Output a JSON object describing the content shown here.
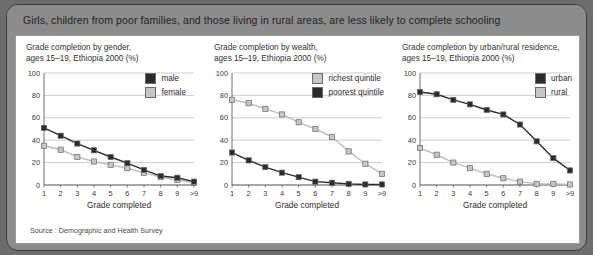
{
  "header": {
    "title": "Girls, children from poor families, and those living in rural areas, are less likely to complete schooling",
    "background": "#8c8c8c",
    "text_color": "#1f1f1f"
  },
  "source": {
    "label": "Source : Demographic and Health Survey"
  },
  "colors": {
    "dark_marker": "#2b2b2b",
    "light_marker": "#c6c6c6",
    "marker_edge": "#6b6b6b",
    "gridline": "#b9b9b9",
    "axis": "#4a4a4a",
    "panel_background": "#ffffff"
  },
  "chart_data": [
    {
      "type": "line",
      "panel_index": 0,
      "title": "Grade completion by gender,\nages 15–19, Ethiopia 2000 (%)",
      "xlabel": "Grade completed",
      "ylabel": "",
      "categories": [
        "1",
        "2",
        "3",
        "4",
        "5",
        "6",
        "7",
        "8",
        "9",
        ">9"
      ],
      "ylim": [
        0,
        100
      ],
      "yticks": [
        0,
        20,
        40,
        60,
        80,
        100
      ],
      "grid": true,
      "legend_position": "top-right",
      "series": [
        {
          "name": "male",
          "color": "#2b2b2b",
          "values": [
            51,
            44,
            37,
            31,
            25,
            19.5,
            13.5,
            8,
            6.5,
            3
          ]
        },
        {
          "name": "female",
          "color": "#c6c6c6",
          "values": [
            35,
            31.5,
            25,
            21,
            18,
            15,
            11,
            7,
            4.5,
            2
          ]
        }
      ]
    },
    {
      "type": "line",
      "panel_index": 1,
      "title": "Grade completion by wealth,\nages 15–19, Ethiopia 2000 (%)",
      "xlabel": "Grade completed",
      "ylabel": "",
      "categories": [
        "1",
        "2",
        "3",
        "4",
        "5",
        "6",
        "7",
        "8",
        "9",
        ">9"
      ],
      "ylim": [
        0,
        100
      ],
      "yticks": [
        0,
        20,
        40,
        60,
        80,
        100
      ],
      "grid": true,
      "legend_position": "top-right",
      "series": [
        {
          "name": "richest quintile",
          "color": "#c6c6c6",
          "values": [
            76,
            73,
            68,
            63,
            56,
            50,
            43,
            30,
            19,
            10
          ]
        },
        {
          "name": "poorest quintile",
          "color": "#2b2b2b",
          "values": [
            29,
            22,
            16,
            11,
            7,
            3,
            2,
            1,
            0.5,
            0.5
          ]
        }
      ]
    },
    {
      "type": "line",
      "panel_index": 2,
      "title": "Grade completion by urban/rural residence,\nages 15–19, Ethiopia 2000 (%)",
      "xlabel": "Grade completed",
      "ylabel": "",
      "categories": [
        "1",
        "2",
        "3",
        "4",
        "5",
        "6",
        "7",
        "8",
        "9",
        ">9"
      ],
      "ylim": [
        0,
        100
      ],
      "yticks": [
        0,
        20,
        40,
        60,
        80,
        100
      ],
      "grid": true,
      "legend_position": "top-right",
      "series": [
        {
          "name": "urban",
          "color": "#2b2b2b",
          "values": [
            83,
            81,
            76,
            72,
            67,
            63,
            54,
            39,
            24,
            13
          ]
        },
        {
          "name": "rural",
          "color": "#c6c6c6",
          "values": [
            33,
            27,
            20,
            15,
            10,
            6,
            3,
            1,
            1,
            0.5
          ]
        }
      ]
    }
  ]
}
